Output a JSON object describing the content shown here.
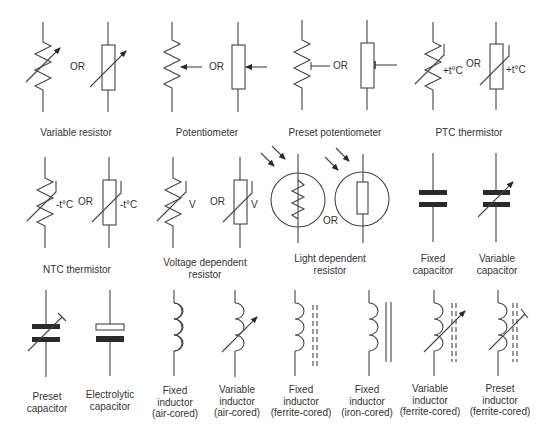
{
  "diagram": {
    "or_text": "OR",
    "colors": {
      "stroke": "#444444",
      "text": "#333333",
      "background": "#ffffff"
    },
    "symbols": [
      {
        "id": "variable-resistor",
        "label": "Variable resistor",
        "variants": [
          "zigzag",
          "rectangle"
        ]
      },
      {
        "id": "potentiometer",
        "label": "Potentiometer",
        "variants": [
          "zigzag",
          "rectangle"
        ]
      },
      {
        "id": "preset-potentiometer",
        "label": "Preset potentiometer",
        "variants": [
          "zigzag",
          "rectangle"
        ]
      },
      {
        "id": "ptc-thermistor",
        "label": "PTC thermistor",
        "annotation": "+t°C",
        "variants": [
          "zigzag",
          "rectangle"
        ]
      },
      {
        "id": "ntc-thermistor",
        "label": "NTC thermistor",
        "annotation": "-t°C",
        "variants": [
          "zigzag",
          "rectangle"
        ]
      },
      {
        "id": "voltage-dependent-resistor",
        "label_line1": "Voltage dependent",
        "label_line2": "resistor",
        "annotation": "V",
        "variants": [
          "zigzag",
          "rectangle"
        ]
      },
      {
        "id": "light-dependent-resistor",
        "label_line1": "Light dependent",
        "label_line2": "resistor",
        "variants": [
          "zigzag",
          "rectangle"
        ]
      },
      {
        "id": "fixed-capacitor",
        "label_line1": "Fixed",
        "label_line2": "capacitor"
      },
      {
        "id": "variable-capacitor",
        "label_line1": "Variable",
        "label_line2": "capacitor"
      },
      {
        "id": "preset-capacitor",
        "label_line1": "Preset",
        "label_line2": "capacitor"
      },
      {
        "id": "electrolytic-capacitor",
        "label_line1": "Electrolytic",
        "label_line2": "capacitor"
      },
      {
        "id": "fixed-inductor-air",
        "label_line1": "Fixed",
        "label_line2": "inductor",
        "label_line3": "(air-cored)"
      },
      {
        "id": "variable-inductor-air",
        "label_line1": "Variable",
        "label_line2": "inductor",
        "label_line3": "(air-cored)"
      },
      {
        "id": "fixed-inductor-ferrite",
        "label_line1": "Fixed",
        "label_line2": "inductor",
        "label_line3": "(ferrite-cored)"
      },
      {
        "id": "fixed-inductor-iron",
        "label_line1": "Fixed",
        "label_line2": "inductor",
        "label_line3": "(iron-cored)"
      },
      {
        "id": "variable-inductor-ferrite",
        "label_line1": "Variable",
        "label_line2": "inductor",
        "label_line3": "(ferrite-cored)"
      },
      {
        "id": "preset-inductor-ferrite",
        "label_line1": "Preset",
        "label_line2": "inductor",
        "label_line3": "(ferrite-cored)"
      }
    ]
  }
}
